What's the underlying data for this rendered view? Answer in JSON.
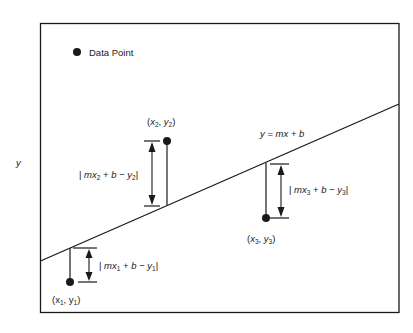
{
  "diagram": {
    "axis_label_y": "y",
    "legend": {
      "marker": "filled-circle",
      "label": "Data Point"
    },
    "line": {
      "equation_parts": [
        "y",
        " = ",
        "mx",
        " + ",
        "b"
      ],
      "label": "y = mx + b"
    },
    "points": [
      {
        "name": "point-1",
        "label_var_x": "x",
        "label_sub_x": "1",
        "label_var_y": "y",
        "label_sub_y": "1",
        "label": "(x1, y1)",
        "residual_label": "| mx1 + b − y1|",
        "res_pre": "| ",
        "res_m": "mx",
        "res_sub1": "1",
        "res_mid": " + ",
        "res_b": "b",
        "res_minus": " − ",
        "res_y": "y",
        "res_sub2": "1",
        "res_post": "|"
      },
      {
        "name": "point-2",
        "label_var_x": "x",
        "label_sub_x": "2",
        "label_var_y": "y",
        "label_sub_y": "2",
        "label": "(x2, y2)",
        "residual_label": "| mx2 + b − y2|",
        "res_pre": "| ",
        "res_m": "mx",
        "res_sub1": "2",
        "res_mid": " + ",
        "res_b": "b",
        "res_minus": " − ",
        "res_y": "y",
        "res_sub2": "2",
        "res_post": "|"
      },
      {
        "name": "point-3",
        "label_var_x": "x",
        "label_sub_x": "3",
        "label_var_y": "y",
        "label_sub_y": "3",
        "label": "(x3, y3)",
        "residual_label": "| mx3 + b − y3|",
        "res_pre": "| ",
        "res_m": "mx",
        "res_sub1": "3",
        "res_mid": " + ",
        "res_b": "b",
        "res_minus": " − ",
        "res_y": "y",
        "res_sub2": "3",
        "res_post": "|"
      }
    ],
    "punct": {
      "open": "(",
      "comma": ", ",
      "close": ")"
    },
    "colors": {
      "stroke": "#1a1a1a",
      "background": "#ffffff"
    }
  }
}
